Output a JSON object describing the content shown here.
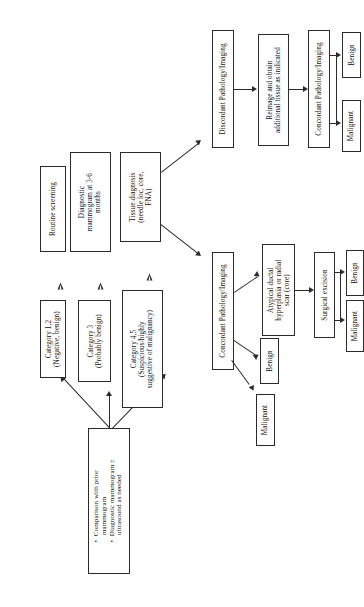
{
  "diagram": {
    "orientation": "rotated-90-ccw",
    "nodes": {
      "initial_workup": "•  Comparison with prior\n    mammogram\n•  Diagnostic mammogram ±\n    ultrasound as needed",
      "category_12": "Category 1,2\n(Negative, benign)",
      "routine_screening": "Routine screening",
      "category_3": "Category 3\n(Probably benign)",
      "diagnostic_mammogram": "Diagnostic\nmammogram at 3-6\nmonths",
      "category_45": "Category 4,5\n(Suspicious/highly\nsuggestive of malignancy)",
      "tissue_diagnosis": "Tissue diagnosis\n(needle loc, core,\nFNA)",
      "discordant": "Discordant Pathology/Imaging",
      "concordant_left": "Concordant Pathology/Imaging",
      "reimage": "Reimage and obtain\nadditional tissue as indicated",
      "concordant_right": "Concordant Pathology/Imaging",
      "benign_top": "Benign",
      "malignant_top": "Malignant",
      "atypical": "Atypical ductal\nhyperplasia or radial\nscar (core)",
      "surgical_excision": "Surgical excision",
      "benign_mid": "Benign",
      "malignant_mid": "Malignant",
      "benign_low": "Benign",
      "malignant_low": "Malignant"
    },
    "colors": {
      "stroke": "#2b2b2b",
      "fill": "#ffffff",
      "text": "#111111"
    }
  }
}
